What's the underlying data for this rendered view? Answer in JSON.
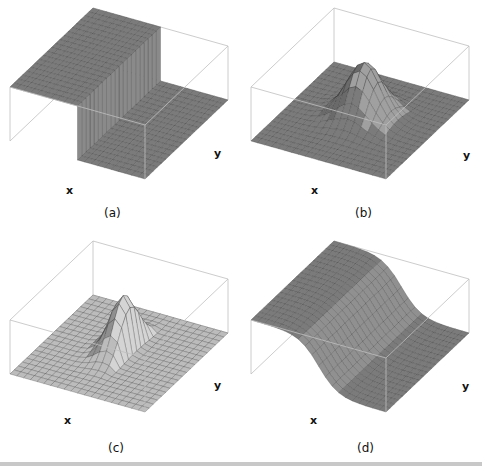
{
  "figure": {
    "panels": [
      {
        "id": "a",
        "caption": "(a)",
        "x_label": "x",
        "y_label": "y",
        "surface": "step",
        "description": "Step function: high plateau on one half, dropping vertically to floor",
        "fill": "#7b7b7b",
        "fill_dark": "#6c6c6c",
        "fill_light": "#8a8a8a"
      },
      {
        "id": "b",
        "caption": "(b)",
        "x_label": "x",
        "y_label": "y",
        "surface": "gaussian",
        "description": "2D Gaussian bump centered on a flat plane",
        "fill": "#7b7b7b",
        "fill_dark": "#6a6a6a",
        "fill_light": "#a0a0a0"
      },
      {
        "id": "c",
        "caption": "(c)",
        "x_label": "x",
        "y_label": "y",
        "surface": "half-gaussian",
        "description": "Gaussian bump with a sharp edge (half-gaussian ridge)",
        "fill": "#bcbcbc",
        "fill_dark": "#8f8f8f",
        "fill_light": "#d4d4d4"
      },
      {
        "id": "d",
        "caption": "(d)",
        "x_label": "x",
        "y_label": "y",
        "surface": "smooth-step",
        "description": "Smooth step (sigmoid) from high plateau to floor",
        "fill": "#7b7b7b",
        "fill_dark": "#686868",
        "fill_light": "#909090"
      }
    ],
    "box_color": "#bfbfbf",
    "grid_color": "#2a2a2a"
  }
}
